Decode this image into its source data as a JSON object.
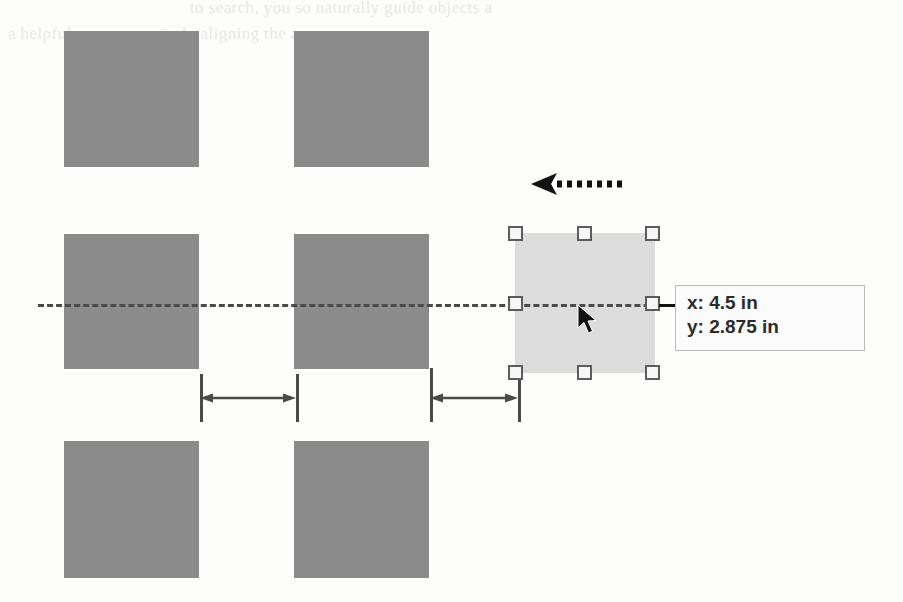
{
  "figure": {
    "kind": "drawing-canvas-illustration",
    "canvas": {
      "width": 903,
      "height": 602,
      "background": "#fdfdfc"
    },
    "colors": {
      "object_fill": "#8b8b8b",
      "selection_fill": "#dcdcdc",
      "handle_fill": "#f6f6f6",
      "handle_border": "#5c5c5c",
      "guide_line": "#4a4a4a",
      "dimension_line": "#4a4a4a",
      "tooltip_background": "#fbfbfb",
      "tooltip_border": "#b9b9b9",
      "tooltip_text": "#2b2b2b",
      "cursor": "#111111",
      "ghost_text": "#e9e7e4"
    },
    "ghost_text": {
      "line1": "to search, you so naturally guide objects a",
      "line2": "a helpful means, precisely aligning the arran"
    },
    "objects": [
      {
        "name": "object-row1-col1",
        "x": 64,
        "y": 31,
        "width": 135,
        "height": 136
      },
      {
        "name": "object-row1-col2",
        "x": 294,
        "y": 31,
        "width": 135,
        "height": 136
      },
      {
        "name": "object-row2-col1",
        "x": 64,
        "y": 234,
        "width": 135,
        "height": 135
      },
      {
        "name": "object-row2-col2",
        "x": 294,
        "y": 234,
        "width": 135,
        "height": 135
      },
      {
        "name": "object-row3-col1",
        "x": 64,
        "y": 441,
        "width": 135,
        "height": 137
      },
      {
        "name": "object-row3-col2",
        "x": 294,
        "y": 441,
        "width": 135,
        "height": 137
      }
    ],
    "alignment_guide": {
      "label": "horizontal-center-alignment-guide",
      "x": 38,
      "y": 304,
      "length": 630,
      "style": "dashed"
    },
    "selected_object": {
      "label": "selected-object",
      "x": 515,
      "y": 233,
      "width": 140,
      "height": 140,
      "handles": [
        {
          "name": "handle-top-left",
          "cx": 516,
          "cy": 234
        },
        {
          "name": "handle-top-center",
          "cx": 585,
          "cy": 234
        },
        {
          "name": "handle-top-right",
          "cx": 653,
          "cy": 234
        },
        {
          "name": "handle-middle-left",
          "cx": 516,
          "cy": 304
        },
        {
          "name": "handle-middle-right",
          "cx": 653,
          "cy": 304
        },
        {
          "name": "handle-bottom-left",
          "cx": 516,
          "cy": 373
        },
        {
          "name": "handle-bottom-center",
          "cx": 585,
          "cy": 373
        },
        {
          "name": "handle-bottom-right",
          "cx": 653,
          "cy": 373
        }
      ]
    },
    "cursor": {
      "label": "mouse-pointer",
      "x": 577,
      "y": 305
    },
    "motion_arrow": {
      "label": "drag-direction-arrow",
      "direction": "left",
      "tip_x": 531,
      "tail_x": 621,
      "y": 184,
      "style": "dotted"
    },
    "dimensions": [
      {
        "name": "spacing-dimension-left",
        "from_x": 200,
        "to_x": 296,
        "y": 398,
        "ext_top": 374,
        "ext_bottom": 422
      },
      {
        "name": "spacing-dimension-right",
        "from_x": 430,
        "to_x": 518,
        "y": 398,
        "ext_top": 368,
        "ext_bottom": 422
      }
    ],
    "tooltip": {
      "label": "coordinate-tooltip",
      "x": 675,
      "y": 285,
      "width": 190,
      "height": 66,
      "x_label": "x: 4.5 in",
      "y_label": "y: 2.875 in",
      "leader": {
        "from_x": 659,
        "to_x": 676,
        "y": 304
      }
    }
  }
}
